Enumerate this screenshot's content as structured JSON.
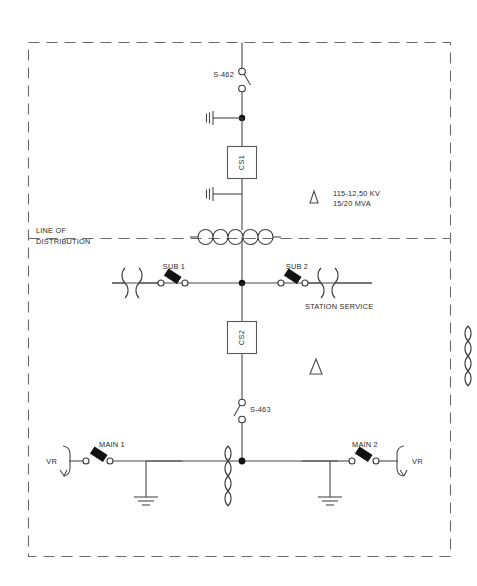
{
  "diagram": {
    "type": "electrical-single-line-diagram",
    "border_style": "dashed",
    "divider": {
      "label_line1": "LINE OF",
      "label_line2": "DISTRIBUTION",
      "style": "dashed"
    },
    "transformer_rating": {
      "symbol": "delta",
      "line1": "115-12,50 KV",
      "line2": "15/20 MVA"
    },
    "second_delta": {
      "symbol": "delta",
      "label": ""
    },
    "switches": [
      {
        "id": "s462",
        "label": "S-462",
        "kind": "disconnect-switch",
        "state": "open"
      },
      {
        "id": "s463",
        "label": "S-463",
        "kind": "disconnect-switch",
        "state": "open"
      }
    ],
    "breakers": [
      {
        "id": "cs1",
        "label": "CS1",
        "kind": "circuit-switcher"
      },
      {
        "id": "cs2",
        "label": "CS2",
        "kind": "circuit-switcher"
      }
    ],
    "fused_switches": [
      {
        "id": "sub1",
        "label": "SUB 1",
        "kind": "fused-cutout"
      },
      {
        "id": "sub2",
        "label": "SUB 2",
        "kind": "fused-cutout"
      },
      {
        "id": "main1",
        "label": "MAIN 1",
        "kind": "fused-cutout"
      },
      {
        "id": "main2",
        "label": "MAIN 2",
        "kind": "fused-cutout"
      }
    ],
    "regulators": [
      {
        "id": "vr_left",
        "label": "VR",
        "kind": "voltage-regulator"
      },
      {
        "id": "vr_right",
        "label": "VR",
        "kind": "voltage-regulator"
      }
    ],
    "annotations": [
      {
        "id": "station_service",
        "label": "STATION SERVICE"
      }
    ],
    "arresters": [
      {
        "id": "arr_top",
        "kind": "surge-arrester"
      },
      {
        "id": "arr_bottom",
        "kind": "surge-arrester"
      }
    ],
    "grounds": [
      {
        "id": "gnd_left",
        "kind": "earth-ground"
      },
      {
        "id": "gnd_right",
        "kind": "earth-ground"
      }
    ],
    "colors": {
      "line": "#4a4a4a",
      "dash": "#6b6b6b",
      "node": "#111111",
      "text": "#2b2b2b",
      "background": "#ffffff"
    }
  }
}
